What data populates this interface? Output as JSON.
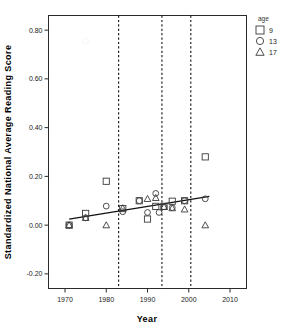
{
  "chart_data": {
    "type": "scatter",
    "title": "",
    "xlabel": "Year",
    "ylabel": "Standardized National Average Reading Score",
    "xlim": [
      1966,
      2014
    ],
    "ylim": [
      -0.26,
      0.86
    ],
    "xticks": [
      1970,
      1980,
      1990,
      2000,
      2010
    ],
    "xtick_labels": [
      "1970",
      "1980",
      "1990",
      "2000",
      "2010"
    ],
    "yticks": [
      -0.2,
      0.0,
      0.2,
      0.4,
      0.6,
      0.8
    ],
    "ytick_labels": [
      "-0.20",
      "0.00",
      "0.20",
      "0.40",
      "0.60",
      "0.80"
    ],
    "grid": false,
    "legend": {
      "title": "age",
      "position": "outside-top-right",
      "entries": [
        {
          "label": "9",
          "marker": "square"
        },
        {
          "label": "13",
          "marker": "circle"
        },
        {
          "label": "17",
          "marker": "triangle"
        }
      ]
    },
    "vertical_reference_lines": [
      1983,
      1993.5,
      2000.5
    ],
    "trend_line": {
      "x": [
        1971,
        2005
      ],
      "y": [
        0.025,
        0.118
      ]
    },
    "series": [
      {
        "name": "9",
        "marker": "square",
        "points": [
          {
            "x": 1971,
            "y": 0.0
          },
          {
            "x": 1975,
            "y": 0.048
          },
          {
            "x": 1980,
            "y": 0.18
          },
          {
            "x": 1984,
            "y": 0.068
          },
          {
            "x": 1988,
            "y": 0.1
          },
          {
            "x": 1990,
            "y": 0.025
          },
          {
            "x": 1992,
            "y": 0.077
          },
          {
            "x": 1994,
            "y": 0.077
          },
          {
            "x": 1996,
            "y": 0.098
          },
          {
            "x": 1999,
            "y": 0.1
          },
          {
            "x": 2004,
            "y": 0.28
          }
        ]
      },
      {
        "name": "13",
        "marker": "circle",
        "points": [
          {
            "x": 1971,
            "y": 0.0
          },
          {
            "x": 1975,
            "y": 0.03
          },
          {
            "x": 1980,
            "y": 0.078
          },
          {
            "x": 1984,
            "y": 0.055
          },
          {
            "x": 1988,
            "y": 0.1
          },
          {
            "x": 1990,
            "y": 0.052
          },
          {
            "x": 1992,
            "y": 0.13
          },
          {
            "x": 1992.8,
            "y": 0.052
          },
          {
            "x": 1994,
            "y": 0.075
          },
          {
            "x": 1996,
            "y": 0.072
          },
          {
            "x": 1999,
            "y": 0.1
          },
          {
            "x": 2004,
            "y": 0.108
          }
        ]
      },
      {
        "name": "17",
        "marker": "triangle",
        "points": [
          {
            "x": 1971,
            "y": 0.0
          },
          {
            "x": 1975,
            "y": 0.03
          },
          {
            "x": 1980,
            "y": 0.0
          },
          {
            "x": 1984,
            "y": 0.07
          },
          {
            "x": 1990,
            "y": 0.108
          },
          {
            "x": 1992,
            "y": 0.112
          },
          {
            "x": 1994,
            "y": 0.075
          },
          {
            "x": 1996,
            "y": 0.07
          },
          {
            "x": 1999,
            "y": 0.065
          },
          {
            "x": 2004,
            "y": 0.0
          }
        ]
      }
    ],
    "faint_artifacts": [
      {
        "x": 1975,
        "y": 0.755,
        "marker": "circle"
      }
    ]
  }
}
